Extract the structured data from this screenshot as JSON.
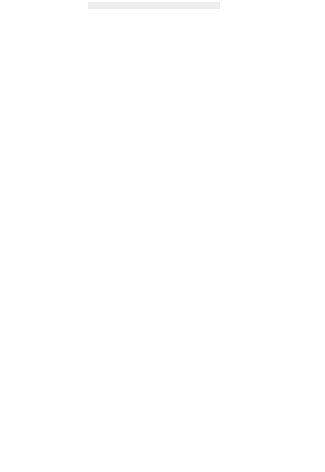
{
  "figure": {
    "background": "#ffffff",
    "point_color": "#111111",
    "axis_color": "#1a1a1a",
    "smudge_color": "#e7e7e7"
  },
  "chart_data": [
    {
      "id": "loading-dose",
      "type": "scatter",
      "title": "",
      "xlabel": "Age (years)",
      "ylabel": "Response to loading dose",
      "xlim": [
        0,
        90
      ],
      "ylim": [
        0,
        900
      ],
      "xticks": [
        0,
        10,
        20,
        30,
        40,
        50,
        60,
        70,
        80,
        90
      ],
      "yticks": [
        0,
        100,
        200,
        300,
        400,
        500,
        600,
        700,
        800,
        900
      ],
      "xticklabels": [
        "0",
        "10",
        "20",
        "30",
        "40",
        "50",
        "60",
        "70",
        "80",
        "90"
      ],
      "yticklabels": [
        "",
        "100",
        "200",
        "300",
        "400",
        "500",
        "600",
        "700",
        "800",
        "900"
      ],
      "grid": false,
      "legend": "none",
      "points": [
        [
          24,
          627
        ],
        [
          24,
          498
        ],
        [
          24,
          341
        ],
        [
          24,
          270
        ],
        [
          29,
          625
        ],
        [
          30,
          325
        ],
        [
          30,
          318
        ],
        [
          31,
          330
        ],
        [
          33,
          532
        ],
        [
          34,
          357
        ],
        [
          45,
          466
        ],
        [
          45,
          268
        ],
        [
          46,
          849
        ],
        [
          46,
          618
        ],
        [
          46,
          580
        ],
        [
          46,
          330
        ],
        [
          46,
          311
        ],
        [
          47,
          465
        ],
        [
          47,
          246
        ],
        [
          47,
          90
        ],
        [
          49,
          832
        ],
        [
          50,
          291
        ],
        [
          52,
          389
        ],
        [
          52,
          381
        ],
        [
          54,
          460
        ],
        [
          54,
          338
        ],
        [
          55,
          320
        ],
        [
          55,
          296
        ],
        [
          55,
          262
        ],
        [
          56,
          277
        ],
        [
          56,
          232
        ],
        [
          57,
          347
        ],
        [
          57,
          318
        ],
        [
          57,
          240
        ],
        [
          58,
          225
        ],
        [
          58,
          201
        ],
        [
          59,
          519
        ],
        [
          59,
          300
        ],
        [
          59,
          238
        ],
        [
          60,
          282
        ],
        [
          61,
          636
        ],
        [
          61,
          352
        ],
        [
          61,
          231
        ],
        [
          62,
          437
        ],
        [
          62,
          281
        ],
        [
          63,
          479
        ],
        [
          63,
          399
        ],
        [
          63,
          360
        ],
        [
          64,
          425
        ],
        [
          64,
          390
        ],
        [
          64,
          374
        ],
        [
          65,
          553
        ],
        [
          65,
          546
        ],
        [
          65,
          404
        ],
        [
          65,
          345
        ],
        [
          66,
          384
        ],
        [
          66,
          339
        ],
        [
          66,
          333
        ],
        [
          67,
          322
        ],
        [
          67,
          316
        ],
        [
          67,
          312
        ],
        [
          67,
          299
        ],
        [
          68,
          266
        ],
        [
          68,
          248
        ],
        [
          68,
          242
        ],
        [
          68,
          175
        ],
        [
          68,
          156
        ],
        [
          68,
          138
        ],
        [
          69,
          374
        ],
        [
          69,
          219
        ],
        [
          70,
          411
        ],
        [
          70,
          207
        ],
        [
          70,
          205
        ],
        [
          71,
          290
        ],
        [
          74,
          467
        ],
        [
          74,
          460
        ],
        [
          75,
          371
        ],
        [
          79,
          368
        ],
        [
          80,
          228
        ],
        [
          81,
          322
        ],
        [
          83,
          272
        ],
        [
          83,
          249
        ],
        [
          84,
          406
        ],
        [
          86,
          197
        ]
      ]
    },
    {
      "id": "maintenance-dose",
      "type": "scatter",
      "title": "",
      "xlabel": "",
      "ylabel": "Response to maintenance dose",
      "xlim": [
        0,
        90
      ],
      "ylim": [
        0,
        6000
      ],
      "xticks": [
        0,
        10,
        20,
        30,
        40,
        50,
        60,
        70,
        80,
        90
      ],
      "yticks": [
        0,
        1000,
        2000,
        3000,
        4000,
        5000,
        6000
      ],
      "xticklabels": [
        "",
        "",
        "",
        "",
        "",
        "",
        "",
        "",
        "",
        ""
      ],
      "yticklabels": [
        "0",
        "1000",
        "2000",
        "3000",
        "4000",
        "5000",
        "6000"
      ],
      "grid": false,
      "legend": "none",
      "points": [
        [
          24,
          2185
        ],
        [
          24,
          1845
        ],
        [
          24,
          1480
        ],
        [
          24,
          1195
        ],
        [
          30,
          3200
        ],
        [
          31,
          1720
        ],
        [
          32,
          4880
        ],
        [
          33,
          5245
        ],
        [
          34,
          1865
        ],
        [
          44,
          660
        ],
        [
          45,
          2675
        ],
        [
          45,
          1790
        ],
        [
          46,
          4450
        ],
        [
          46,
          2695
        ],
        [
          46,
          2195
        ],
        [
          46,
          1205
        ],
        [
          47,
          3890
        ],
        [
          47,
          1370
        ],
        [
          47,
          880
        ],
        [
          48,
          690
        ],
        [
          50,
          1810
        ],
        [
          51,
          1340
        ],
        [
          52,
          1310
        ],
        [
          53,
          2700
        ],
        [
          54,
          1205
        ],
        [
          54,
          575
        ],
        [
          55,
          2430
        ],
        [
          55,
          1235
        ],
        [
          55,
          1120
        ],
        [
          56,
          2255
        ],
        [
          56,
          1085
        ],
        [
          56,
          1040
        ],
        [
          57,
          2530
        ],
        [
          57,
          1320
        ],
        [
          57,
          790
        ],
        [
          58,
          2205
        ],
        [
          58,
          1295
        ],
        [
          58,
          800
        ],
        [
          59,
          2150
        ],
        [
          59,
          2090
        ],
        [
          60,
          2430
        ],
        [
          60,
          2185
        ],
        [
          60,
          1545
        ],
        [
          61,
          3220
        ],
        [
          61,
          3160
        ],
        [
          62,
          3215
        ],
        [
          62,
          2610
        ],
        [
          62,
          2575
        ],
        [
          63,
          2120
        ],
        [
          63,
          1335
        ],
        [
          63,
          905
        ],
        [
          64,
          4235
        ],
        [
          64,
          4060
        ],
        [
          64,
          2060
        ],
        [
          64,
          1390
        ],
        [
          64,
          1345
        ],
        [
          65,
          2590
        ],
        [
          65,
          1855
        ],
        [
          65,
          1330
        ],
        [
          66,
          5055
        ],
        [
          66,
          2130
        ],
        [
          66,
          1980
        ],
        [
          66,
          625
        ],
        [
          67,
          1910
        ],
        [
          67,
          860
        ],
        [
          67,
          700
        ],
        [
          68,
          2055
        ],
        [
          68,
          1335
        ],
        [
          68,
          600
        ],
        [
          70,
          5030
        ],
        [
          70,
          2465
        ],
        [
          71,
          2105
        ],
        [
          72,
          1600
        ],
        [
          75,
          2455
        ],
        [
          77,
          1760
        ],
        [
          78,
          2380
        ],
        [
          78,
          2185
        ],
        [
          80,
          1700
        ],
        [
          82,
          1320
        ],
        [
          83,
          1775
        ]
      ]
    }
  ]
}
